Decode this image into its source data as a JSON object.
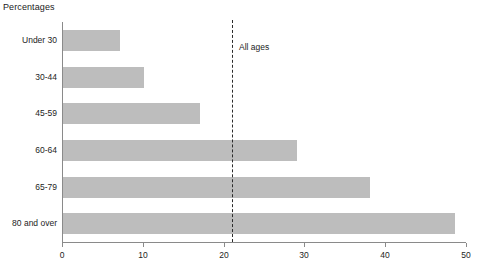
{
  "chart_data": {
    "type": "bar",
    "orientation": "horizontal",
    "title": "Percentages",
    "xlabel": "",
    "ylabel": "",
    "categories": [
      "Under 30",
      "30-44",
      "45-59",
      "60-64",
      "65-79",
      "80 and over"
    ],
    "values": [
      7,
      10,
      17,
      29,
      38,
      48.5
    ],
    "xlim": [
      0,
      50
    ],
    "xticks": [
      0,
      10,
      20,
      30,
      40,
      50
    ],
    "xtick_labels": [
      "0",
      "10",
      "20",
      "30",
      "40",
      "50"
    ],
    "grid": false,
    "legend": false,
    "bar_color": "#bdbdbd",
    "axis_color": "#8a8a8a",
    "annotations": [
      {
        "name": "all-ages-reference",
        "label": "All ages",
        "value": 21,
        "style": "dashed-vertical-line",
        "color": "#2a2a2a"
      }
    ]
  }
}
